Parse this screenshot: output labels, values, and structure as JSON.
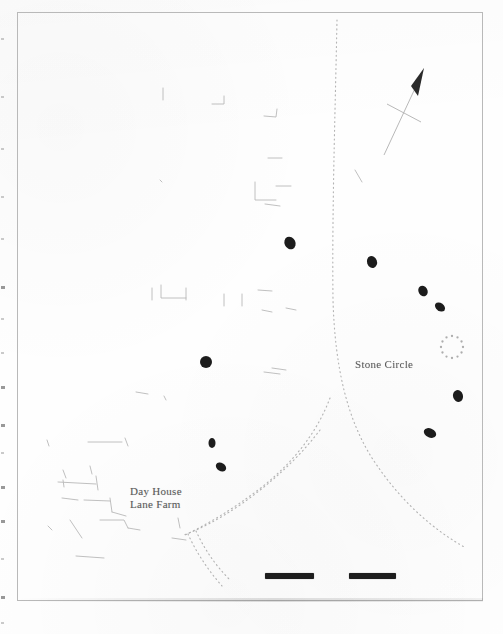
{
  "document": {
    "kind": "scanned-map-figure",
    "media": "photocopy",
    "page_background": "#fefefe",
    "ink_color": "#5a5a5a",
    "marker_color": "#1d1d1d",
    "frame_color": "#b9b9b9"
  },
  "map": {
    "frame": {
      "x": 17,
      "y": 12,
      "width": 466,
      "height": 589
    },
    "labels": [
      {
        "id": "stone-circle",
        "text": "Stone Circle",
        "x": 355,
        "y": 358
      },
      {
        "id": "day-house-lane-farm",
        "text": "Day House\nLane Farm",
        "x": 130,
        "y": 485
      }
    ],
    "north_arrow": {
      "name": "north-arrow",
      "tip": {
        "x": 424,
        "y": 70
      },
      "tail": {
        "x": 384,
        "y": 155
      },
      "crossbar_center": {
        "x": 404,
        "y": 113
      }
    },
    "stone_circle_symbol": {
      "name": "dotted-ring-symbol",
      "center": {
        "x": 452,
        "y": 347
      },
      "radius": 11,
      "dot_count": 12
    },
    "stones": [
      {
        "id": "stone-1",
        "x": 290,
        "y": 243,
        "rx": 5.5,
        "ry": 6.5,
        "rot": -25
      },
      {
        "id": "stone-2",
        "x": 372,
        "y": 262,
        "rx": 5.0,
        "ry": 6.0,
        "rot": -20
      },
      {
        "id": "stone-3",
        "x": 423,
        "y": 291,
        "rx": 4.5,
        "ry": 5.5,
        "rot": -30
      },
      {
        "id": "stone-4",
        "x": 440,
        "y": 307,
        "rx": 5.5,
        "ry": 4.0,
        "rot": 35
      },
      {
        "id": "stone-5",
        "x": 458,
        "y": 396,
        "rx": 5.0,
        "ry": 6.0,
        "rot": -15
      },
      {
        "id": "stone-6",
        "x": 430,
        "y": 433,
        "rx": 6.5,
        "ry": 4.5,
        "rot": 25
      },
      {
        "id": "stone-7",
        "x": 206,
        "y": 362,
        "rx": 6.0,
        "ry": 6.0,
        "rot": 0
      },
      {
        "id": "stone-8",
        "x": 212,
        "y": 443,
        "rx": 3.5,
        "ry": 5.0,
        "rot": 0
      },
      {
        "id": "stone-9",
        "x": 221,
        "y": 467,
        "rx": 5.5,
        "ry": 4.0,
        "rot": 30
      }
    ],
    "scale_bar": {
      "name": "scale-bar",
      "x": 265,
      "y": 573,
      "segments": [
        {
          "offset": 0,
          "length": 49
        },
        {
          "offset": 84,
          "length": 47
        }
      ]
    },
    "tracks": [
      {
        "id": "main-track-curve",
        "style": "dotted",
        "path": "M 337 20 C 335 120, 332 210, 333 300 C 335 370, 348 420, 372 458 C 398 498, 430 528, 466 548"
      },
      {
        "id": "track-branch-a",
        "style": "dotted",
        "path": "M 330 398 C 318 430, 296 460, 262 487 C 232 510, 206 525, 183 536"
      },
      {
        "id": "track-branch-b",
        "style": "dotted",
        "path": "M 320 430 C 298 459, 270 484, 240 505 C 218 520, 200 529, 184 535"
      },
      {
        "id": "track-branch-c",
        "style": "dotted",
        "path": "M 196 531 C 204 548, 214 564, 230 580"
      },
      {
        "id": "track-branch-d",
        "style": "dotted",
        "path": "M 188 534 C 196 552, 208 570, 222 586"
      }
    ],
    "field_boundaries": [
      {
        "id": "fb-1",
        "path": "M 163 88 L 163 100"
      },
      {
        "id": "fb-2",
        "path": "M 212 104 L 224 104 L 224 96"
      },
      {
        "id": "fb-3",
        "path": "M 264 116 L 276 117 L 277 109"
      },
      {
        "id": "fb-4",
        "path": "M 268 158 L 282 158"
      },
      {
        "id": "fb-5",
        "path": "M 255 182 L 255 200 L 276 200"
      },
      {
        "id": "fb-6",
        "path": "M 276 186 L 291 186"
      },
      {
        "id": "fb-7",
        "path": "M 265 204 L 280 206"
      },
      {
        "id": "fb-8",
        "path": "M 160 180 L 162 182"
      },
      {
        "id": "fb-9",
        "path": "M 152 288 L 152 300"
      },
      {
        "id": "fb-10",
        "path": "M 161 285 L 161 298 L 186 298"
      },
      {
        "id": "fb-11",
        "path": "M 186 288 L 186 300"
      },
      {
        "id": "fb-12",
        "path": "M 224 294 L 224 306"
      },
      {
        "id": "fb-13",
        "path": "M 242 294 L 242 306"
      },
      {
        "id": "fb-14",
        "path": "M 258 290 L 272 291"
      },
      {
        "id": "fb-15",
        "path": "M 262 310 L 272 312"
      },
      {
        "id": "fb-16",
        "path": "M 286 308 L 296 310"
      },
      {
        "id": "fb-17",
        "path": "M 264 372 L 280 374"
      },
      {
        "id": "fb-18",
        "path": "M 272 368 L 286 370"
      },
      {
        "id": "fb-19",
        "path": "M 136 392 L 148 394"
      },
      {
        "id": "fb-20",
        "path": "M 164 396 L 166 400"
      },
      {
        "id": "fb-21",
        "path": "M 47 440 L 49 446"
      },
      {
        "id": "fb-22",
        "path": "M 88 442 L 122 442"
      },
      {
        "id": "fb-23",
        "path": "M 125 438 L 128 446"
      },
      {
        "id": "fb-24",
        "path": "M 63 470 L 66 478"
      },
      {
        "id": "fb-25",
        "path": "M 90 466 L 92 474"
      },
      {
        "id": "fb-26",
        "path": "M 63 480 L 64 487"
      },
      {
        "id": "fb-27",
        "path": "M 58 482 L 96 484"
      },
      {
        "id": "fb-28",
        "path": "M 96 476 L 98 490"
      },
      {
        "id": "fb-29",
        "path": "M 62 498 L 78 500"
      },
      {
        "id": "fb-30",
        "path": "M 84 500 L 110 501"
      },
      {
        "id": "fb-31",
        "path": "M 110 498 L 112 512"
      },
      {
        "id": "fb-32",
        "path": "M 112 512 L 126 516"
      },
      {
        "id": "fb-33",
        "path": "M 48 526 L 52 530"
      },
      {
        "id": "fb-34",
        "path": "M 70 520 L 82 538"
      },
      {
        "id": "fb-35",
        "path": "M 100 520 L 124 520 L 128 528"
      },
      {
        "id": "fb-36",
        "path": "M 128 528 L 140 530"
      },
      {
        "id": "fb-37",
        "path": "M 76 556 L 104 558"
      },
      {
        "id": "fb-38",
        "path": "M 178 518 L 180 528"
      },
      {
        "id": "fb-39",
        "path": "M 172 538 L 186 540"
      },
      {
        "id": "fb-40",
        "path": "M 355 170 L 362 182"
      }
    ],
    "edge_artifacts": [
      {
        "y": 38,
        "faint": true
      },
      {
        "y": 96,
        "faint": true
      },
      {
        "y": 148,
        "faint": true
      },
      {
        "y": 196,
        "faint": true
      },
      {
        "y": 238,
        "faint": true
      },
      {
        "y": 286,
        "faint": false
      },
      {
        "y": 318,
        "faint": true
      },
      {
        "y": 352,
        "faint": true
      },
      {
        "y": 386,
        "faint": false
      },
      {
        "y": 424,
        "faint": false
      },
      {
        "y": 452,
        "faint": true
      },
      {
        "y": 486,
        "faint": false
      },
      {
        "y": 520,
        "faint": false
      },
      {
        "y": 558,
        "faint": true
      },
      {
        "y": 596,
        "faint": false
      },
      {
        "y": 622,
        "faint": true
      }
    ]
  }
}
